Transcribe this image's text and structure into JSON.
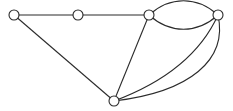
{
  "diagram": {
    "type": "undirected-multigraph",
    "node_count": 5,
    "edge_count": 8,
    "colors": {
      "stroke": "#2b2b2b",
      "node_fill": "#ffffff",
      "background": "#ffffff"
    },
    "nodes": [
      {
        "id": "n1",
        "x": 14,
        "y": 15
      },
      {
        "id": "n2",
        "x": 78,
        "y": 15
      },
      {
        "id": "n3",
        "x": 149,
        "y": 15
      },
      {
        "id": "n4",
        "x": 218,
        "y": 15
      },
      {
        "id": "n5",
        "x": 114,
        "y": 101
      }
    ],
    "edges": [
      {
        "from": "n1",
        "to": "n2",
        "shape": "straight"
      },
      {
        "from": "n2",
        "to": "n3",
        "shape": "straight"
      },
      {
        "from": "n1",
        "to": "n5",
        "shape": "straight"
      },
      {
        "from": "n3",
        "to": "n5",
        "shape": "straight"
      },
      {
        "from": "n3",
        "to": "n4",
        "shape": "arc-above"
      },
      {
        "from": "n3",
        "to": "n4",
        "shape": "arc-below"
      },
      {
        "from": "n4",
        "to": "n5",
        "shape": "curve-inner"
      },
      {
        "from": "n4",
        "to": "n5",
        "shape": "curve-outer"
      }
    ]
  }
}
